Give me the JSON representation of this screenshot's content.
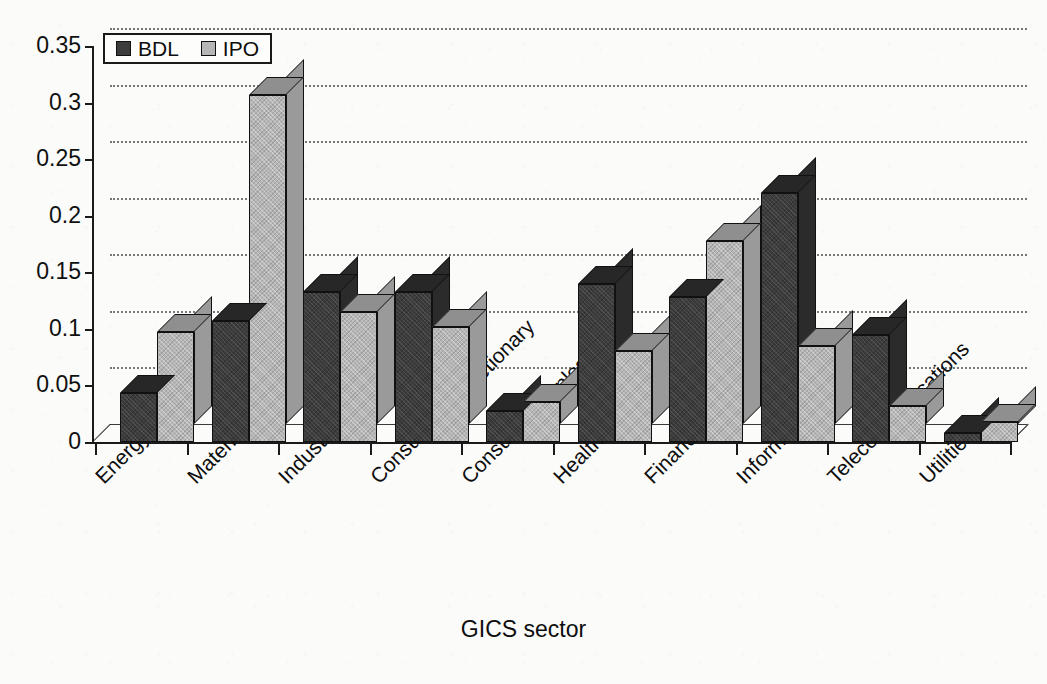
{
  "chart_data": {
    "type": "bar",
    "title": "",
    "subtitle": "",
    "xlabel": "GICS sector",
    "ylabel": "",
    "ylim": [
      0,
      0.35
    ],
    "yticks": [
      0,
      0.05,
      0.1,
      0.15,
      0.2,
      0.25,
      0.3,
      0.35
    ],
    "ytick_labels": [
      "0",
      "0.05",
      "0.1",
      "0.15",
      "0.2",
      "0.25",
      "0.3",
      "0.35"
    ],
    "grid": "horizontal-dotted",
    "legend_position": "top-left-inside",
    "style": "3d-clustered-bars",
    "categories": [
      "Energy",
      "Materials",
      "Industrials",
      "Consumer discretionary",
      "Consumer staples",
      "Health care",
      "Financials",
      "Information technology",
      "Telecommunications",
      "Utilities"
    ],
    "series": [
      {
        "name": "BDL",
        "color": "#3c3c3c",
        "values": [
          0.043,
          0.107,
          0.133,
          0.133,
          0.027,
          0.14,
          0.128,
          0.22,
          0.095,
          0.008
        ]
      },
      {
        "name": "IPO",
        "color": "#b6b6b6",
        "values": [
          0.097,
          0.307,
          0.115,
          0.102,
          0.035,
          0.08,
          0.178,
          0.085,
          0.032,
          0.018
        ]
      }
    ]
  },
  "legend": {
    "items": [
      {
        "label": "BDL",
        "color": "#3c3c3c"
      },
      {
        "label": "IPO",
        "color": "#b6b6b6"
      }
    ]
  },
  "axes": {
    "x_title": "GICS sector"
  }
}
